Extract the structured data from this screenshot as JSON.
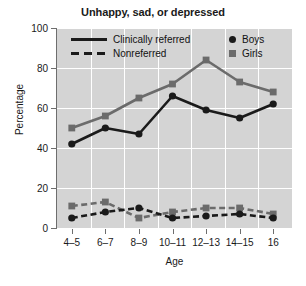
{
  "chart_data": {
    "type": "line",
    "title": "Unhappy, sad, or depressed",
    "xlabel": "Age",
    "ylabel": "Percentage",
    "categories": [
      "4–5",
      "6–7",
      "8–9",
      "10–11",
      "12–13",
      "14–15",
      "16"
    ],
    "ylim": [
      0,
      100
    ],
    "yticks": [
      0,
      20,
      40,
      60,
      80,
      100
    ],
    "ytick_labels": [
      "0",
      "20",
      "40",
      "60",
      "80",
      "100"
    ],
    "grid": true,
    "legend_position": "top-inside",
    "series": [
      {
        "name": "Clinically referred — Girls",
        "group": "Clinically referred",
        "sex": "Girls",
        "marker": "square",
        "line_style": "solid",
        "color": "#6b6b6b",
        "values": [
          50,
          56,
          65,
          72,
          84,
          73,
          68
        ]
      },
      {
        "name": "Clinically referred — Boys",
        "group": "Clinically referred",
        "sex": "Boys",
        "marker": "circle",
        "line_style": "solid",
        "color": "#1a1a1a",
        "values": [
          42,
          50,
          47,
          66,
          59,
          55,
          62
        ]
      },
      {
        "name": "Nonreferred — Girls",
        "group": "Nonreferred",
        "sex": "Girls",
        "marker": "square",
        "line_style": "dashed",
        "color": "#6b6b6b",
        "values": [
          11,
          13,
          5,
          8,
          10,
          10,
          7
        ]
      },
      {
        "name": "Nonreferred — Boys",
        "group": "Nonreferred",
        "sex": "Boys",
        "marker": "circle",
        "line_style": "dashed",
        "color": "#1a1a1a",
        "values": [
          5,
          8,
          10,
          5,
          6,
          7,
          5
        ]
      }
    ],
    "legend": {
      "line_entries": [
        {
          "label": "Clinically referred",
          "style": "solid"
        },
        {
          "label": "Nonreferred",
          "style": "dashed"
        }
      ],
      "marker_entries": [
        {
          "label": "Boys",
          "marker": "circle",
          "color": "#1a1a1a"
        },
        {
          "label": "Girls",
          "marker": "square",
          "color": "#6b6b6b"
        }
      ]
    },
    "colors": {
      "plot_background": "#d4d4d4",
      "gridline": "#ffffff",
      "axis": "#6e6e6e",
      "boys": "#1a1a1a",
      "girls": "#6b6b6b"
    }
  }
}
